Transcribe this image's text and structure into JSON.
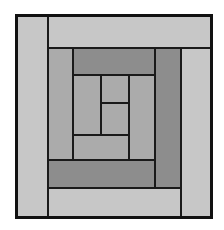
{
  "figure": {
    "kind": "log-cabin-quilt-block",
    "background_color": "#ffffff",
    "canvas": {
      "width": 224,
      "height": 230
    },
    "block_bounds": {
      "x": 16,
      "y": 15,
      "width": 195,
      "height": 202
    },
    "outline_color": "#111111",
    "line_color": "#1a1a1a",
    "line_width": 2,
    "palette": {
      "light": "#c7c7c7",
      "medium": "#ababab",
      "dark": "#8d8d8d",
      "outline": "#111111"
    },
    "ring_count": 4,
    "logs": [
      {
        "name": "ring1-left",
        "ring": 1,
        "side": "left",
        "value": "light",
        "fill": "#c7c7c7",
        "x": 16,
        "y": 15,
        "width": 32,
        "height": 202
      },
      {
        "name": "ring1-top",
        "ring": 1,
        "side": "top",
        "value": "light",
        "fill": "#c7c7c7",
        "x": 48,
        "y": 15,
        "width": 163,
        "height": 33
      },
      {
        "name": "ring1-right",
        "ring": 1,
        "side": "right",
        "value": "light",
        "fill": "#c7c7c7",
        "x": 181,
        "y": 48,
        "width": 30,
        "height": 169
      },
      {
        "name": "ring1-bottom",
        "ring": 1,
        "side": "bottom",
        "value": "light",
        "fill": "#c7c7c7",
        "x": 48,
        "y": 188,
        "width": 133,
        "height": 29
      },
      {
        "name": "ring2-left",
        "ring": 2,
        "side": "left",
        "value": "medium",
        "fill": "#ababab",
        "x": 48,
        "y": 48,
        "width": 25,
        "height": 140
      },
      {
        "name": "ring2-top",
        "ring": 2,
        "side": "top",
        "value": "dark",
        "fill": "#8d8d8d",
        "x": 73,
        "y": 48,
        "width": 108,
        "height": 27
      },
      {
        "name": "ring2-right",
        "ring": 2,
        "side": "right",
        "value": "dark",
        "fill": "#8d8d8d",
        "x": 155,
        "y": 48,
        "width": 26,
        "height": 140
      },
      {
        "name": "ring2-bottom",
        "ring": 2,
        "side": "bottom",
        "value": "dark",
        "fill": "#8d8d8d",
        "x": 48,
        "y": 160,
        "width": 107,
        "height": 28
      },
      {
        "name": "ring3-left",
        "ring": 3,
        "side": "left",
        "value": "medium",
        "fill": "#ababab",
        "x": 73,
        "y": 75,
        "width": 28,
        "height": 60
      },
      {
        "name": "ring3-top",
        "ring": 3,
        "side": "top",
        "value": "medium",
        "fill": "#ababab",
        "x": 101,
        "y": 75,
        "width": 28,
        "height": 28
      },
      {
        "name": "ring3-right",
        "ring": 3,
        "side": "right",
        "value": "medium",
        "fill": "#ababab",
        "x": 129,
        "y": 75,
        "width": 26,
        "height": 85
      },
      {
        "name": "ring3-bottom",
        "ring": 3,
        "side": "bottom",
        "value": "medium",
        "fill": "#ababab",
        "x": 73,
        "y": 135,
        "width": 56,
        "height": 25
      },
      {
        "name": "center-square",
        "ring": 4,
        "side": "center",
        "value": "medium",
        "fill": "#ababab",
        "x": 101,
        "y": 103,
        "width": 28,
        "height": 32
      }
    ]
  }
}
